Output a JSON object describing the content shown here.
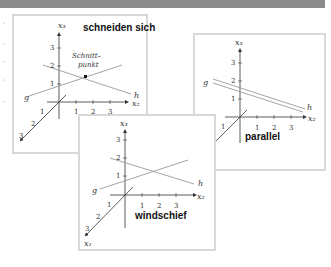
{
  "figure": {
    "panels": [
      {
        "id": "intersecting",
        "caption": "schneiden sich",
        "annotation_line1": "Schnitt–",
        "annotation_line2": "punkt",
        "line_g": "g",
        "line_h": "h",
        "axes": {
          "x1": "x₁",
          "x2": "x₂",
          "x3": "x₃"
        },
        "ticks_x2": [
          "1",
          "2",
          "3"
        ],
        "ticks_x3": [
          "1",
          "2",
          "3"
        ],
        "ticks_x1": [
          "1",
          "2",
          "3"
        ]
      },
      {
        "id": "parallel",
        "caption": "parallel",
        "line_g": "g",
        "line_h": "h",
        "axes": {
          "x1": "x₁",
          "x2": "x₂",
          "x3": "x₃"
        },
        "ticks_x2": [
          "1",
          "2",
          "3"
        ],
        "ticks_x3": [
          "1",
          "2",
          "3"
        ],
        "ticks_x1": [
          "1",
          "2",
          "3"
        ]
      },
      {
        "id": "skew",
        "caption": "windschief",
        "line_g": "g",
        "line_h": "h",
        "axes": {
          "x1": "x₁",
          "x2": "x₂",
          "x3": "x₃"
        },
        "ticks_x2": [
          "1",
          "2",
          "3"
        ],
        "ticks_x3": [
          "1",
          "2",
          "3"
        ],
        "ticks_x1": [
          "1",
          "2",
          "3"
        ]
      }
    ],
    "colors": {
      "topbar": "#8c8c8c",
      "panel_border": "#d8d8d8",
      "axis": "#333333",
      "line": "#9a9a9a"
    }
  }
}
